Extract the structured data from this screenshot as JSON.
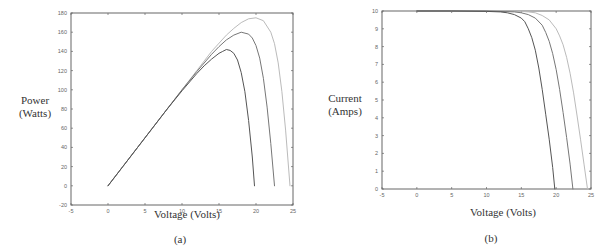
{
  "chart_data": [
    {
      "type": "line",
      "id": "a",
      "caption": "(a)",
      "title": "",
      "xlabel": "Voltage (Volts)",
      "ylabel_line1": "Power",
      "ylabel_line2": "(Watts)",
      "xlim": [
        -5,
        25
      ],
      "ylim": [
        -20,
        180
      ],
      "xticks": [
        -5,
        0,
        5,
        10,
        15,
        20,
        25
      ],
      "yticks": [
        -20,
        0,
        20,
        40,
        60,
        80,
        100,
        120,
        140,
        160,
        180
      ],
      "grid": false,
      "legend": null,
      "series": [
        {
          "name": "curve-1 (low Voc)",
          "color": "#555555",
          "x": [
            0,
            2,
            4,
            6,
            8,
            10,
            12,
            13,
            14,
            15,
            15.5,
            16,
            16.5,
            17,
            17.5,
            18,
            18.5,
            19,
            19.5,
            19.8
          ],
          "y": [
            0,
            20,
            40,
            60,
            80,
            99,
            117,
            125,
            132,
            138,
            140,
            142,
            141,
            138,
            131,
            118,
            98,
            68,
            30,
            0
          ]
        },
        {
          "name": "curve-2 (mid Voc)",
          "color": "#777777",
          "x": [
            0,
            2,
            4,
            6,
            8,
            10,
            12,
            14,
            15,
            16,
            17,
            18,
            19,
            19.5,
            20,
            20.5,
            21,
            21.5,
            22,
            22.5
          ],
          "y": [
            0,
            20,
            40,
            60,
            80,
            100,
            119,
            137,
            145,
            152,
            157,
            160,
            158,
            154,
            146,
            133,
            112,
            82,
            44,
            0
          ]
        },
        {
          "name": "curve-3 (high Voc)",
          "color": "#bbbbbb",
          "x": [
            0,
            2,
            4,
            6,
            8,
            10,
            12,
            14,
            16,
            17,
            18,
            19,
            20,
            21,
            22,
            22.5,
            23,
            23.5,
            24,
            24.6
          ],
          "y": [
            0,
            20,
            40,
            60,
            80,
            100,
            120,
            140,
            157,
            164,
            170,
            174,
            175,
            172,
            160,
            148,
            128,
            98,
            58,
            0
          ]
        }
      ]
    },
    {
      "type": "line",
      "id": "b",
      "caption": "(b)",
      "title": "",
      "xlabel": "Voltage (Volts)",
      "ylabel_line1": "Current",
      "ylabel_line2": "(Amps)",
      "xlim": [
        -5,
        25
      ],
      "ylim": [
        0,
        10
      ],
      "xticks": [
        -5,
        0,
        5,
        10,
        15,
        20,
        25
      ],
      "yticks": [
        0,
        1,
        2,
        3,
        4,
        5,
        6,
        7,
        8,
        9,
        10
      ],
      "grid": false,
      "legend": null,
      "series": [
        {
          "name": "curve-1 (low Voc)",
          "color": "#555555",
          "x": [
            0,
            5,
            10,
            12,
            13,
            14,
            15,
            15.5,
            16,
            16.5,
            17,
            17.5,
            18,
            18.5,
            19,
            19.5,
            19.8
          ],
          "y": [
            10,
            10,
            9.98,
            9.95,
            9.9,
            9.8,
            9.6,
            9.4,
            9.0,
            8.5,
            7.8,
            6.8,
            5.6,
            4.2,
            2.8,
            1.2,
            0
          ]
        },
        {
          "name": "curve-2 (mid Voc)",
          "color": "#777777",
          "x": [
            0,
            5,
            10,
            14,
            15,
            16,
            17,
            18,
            18.5,
            19,
            19.5,
            20,
            20.5,
            21,
            21.5,
            22,
            22.4
          ],
          "y": [
            10,
            10,
            10,
            9.95,
            9.9,
            9.8,
            9.6,
            9.2,
            8.8,
            8.3,
            7.6,
            6.7,
            5.6,
            4.3,
            2.9,
            1.4,
            0
          ]
        },
        {
          "name": "curve-3 (high Voc)",
          "color": "#bbbbbb",
          "x": [
            0,
            5,
            10,
            15,
            16,
            17,
            18,
            19,
            20,
            20.5,
            21,
            21.5,
            22,
            22.5,
            23,
            23.5,
            24,
            24.5
          ],
          "y": [
            10,
            10,
            10,
            9.98,
            9.95,
            9.9,
            9.75,
            9.5,
            9.0,
            8.6,
            8.1,
            7.4,
            6.5,
            5.4,
            4.1,
            2.8,
            1.4,
            0
          ]
        }
      ]
    }
  ],
  "layout": {
    "a": {
      "box": [
        71,
        13,
        293,
        205
      ],
      "x0px": 71,
      "x1px": 293,
      "y0px": 205,
      "y1px": 13
    },
    "b": {
      "box": [
        382,
        11,
        591,
        189
      ],
      "x0px": 382,
      "x1px": 591,
      "y0px": 189,
      "y1px": 11
    }
  },
  "axis_color": "#666666"
}
